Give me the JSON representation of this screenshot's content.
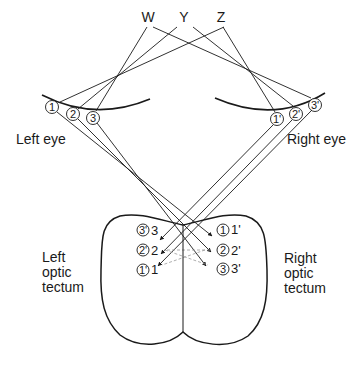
{
  "diagram": {
    "points": {
      "w": "W",
      "y": "Y",
      "z": "Z"
    },
    "eyes": {
      "left_label": "Left eye",
      "right_label": "Right eye",
      "left_receptors": [
        "1",
        "2",
        "3"
      ],
      "right_receptors": [
        "1'",
        "2'",
        "3'"
      ]
    },
    "tectum": {
      "left_label_lines": [
        "Left",
        "optic",
        "tectum"
      ],
      "right_label_lines": [
        "Right",
        "optic",
        "tectum"
      ],
      "left_marks": [
        {
          "circle": "3'",
          "num": "3"
        },
        {
          "circle": "2'",
          "num": "2"
        },
        {
          "circle": "1'",
          "num": "1"
        }
      ],
      "right_marks": [
        {
          "circle": "1",
          "num": "1'"
        },
        {
          "circle": "2",
          "num": "2'"
        },
        {
          "circle": "3",
          "num": "3'"
        }
      ]
    },
    "colors": {
      "line": "#1a1a1a",
      "dashed": "#9a9a9a",
      "background": "#ffffff"
    }
  }
}
